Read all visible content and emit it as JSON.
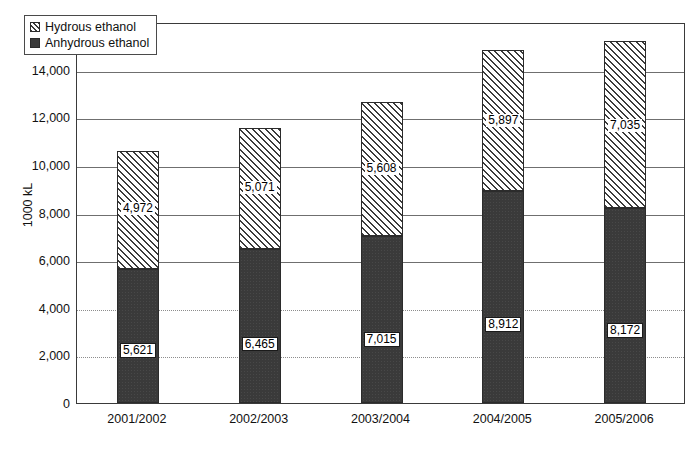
{
  "chart_data": {
    "type": "bar",
    "subtype": "stacked-vertical",
    "title": "",
    "xlabel": "",
    "ylabel": "1000 kL",
    "ylim": [
      0,
      16000
    ],
    "ytick_step": 2000,
    "ytick_labels": [
      "16,000",
      "14,000",
      "12,000",
      "10,000",
      "8,000",
      "6,000",
      "4,000",
      "2,000",
      "0"
    ],
    "ytick_values": [
      16000,
      14000,
      12000,
      10000,
      8000,
      6000,
      4000,
      2000,
      0
    ],
    "grid": true,
    "grid_axis": "y",
    "legend_position": "top-left-inside",
    "categories": [
      "2001/2002",
      "2002/2003",
      "2003/2004",
      "2004/2005",
      "2005/2006"
    ],
    "series": [
      {
        "name": "Anhydrous ethanol",
        "pattern": "solid-dark",
        "color": "#3a3a3a",
        "stack_order": 0,
        "values": [
          5621,
          6465,
          7015,
          8912,
          8172
        ],
        "labels": [
          "5,621",
          "6,465",
          "7,015",
          "8,912",
          "8,172"
        ]
      },
      {
        "name": "Hydrous ethanol",
        "pattern": "diagonal-hatch",
        "color": "#ffffff",
        "stack_order": 1,
        "values": [
          4972,
          5071,
          5608,
          5897,
          7035
        ],
        "labels": [
          "4,972",
          "5,071",
          "5,608",
          "5,897",
          "7,035"
        ]
      }
    ],
    "totals": [
      10593,
      11536,
      12623,
      14809,
      15207
    ]
  },
  "legend": {
    "items": [
      {
        "label": "Hydrous ethanol",
        "swatch": "hydrous"
      },
      {
        "label": "Anhydrous ethanol",
        "swatch": "anhydrous"
      }
    ]
  },
  "colors": {
    "anhydrous": "#3a3a3a",
    "hydrous_hatch": "#3c3c3c",
    "axis": "#3a3a3a",
    "grid": "#6f6f6f",
    "text": "#111111",
    "background": "#ffffff"
  }
}
